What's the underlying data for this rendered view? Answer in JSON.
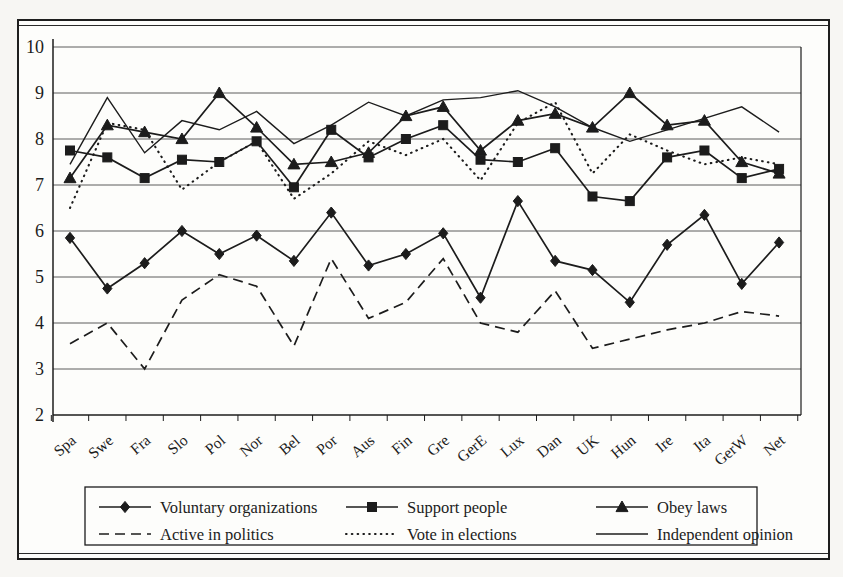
{
  "figure": {
    "background": "#fdfdfb",
    "ink_color": "#1c1c1c",
    "grid_color": "#4a4a4a"
  },
  "chart_data": {
    "type": "line",
    "title": "",
    "xlabel": "",
    "ylabel": "",
    "ylim": [
      2,
      10
    ],
    "yticks": [
      2,
      3,
      4,
      5,
      6,
      7,
      8,
      9,
      10
    ],
    "grid": true,
    "legend_position": "bottom-box",
    "categories": [
      "Spa",
      "Swe",
      "Fra",
      "Slo",
      "Pol",
      "Nor",
      "Bel",
      "Por",
      "Aus",
      "Fin",
      "Gre",
      "GerE",
      "Lux",
      "Dan",
      "UK",
      "Hun",
      "Ire",
      "Ita",
      "GerW",
      "Net"
    ],
    "series": [
      {
        "name": "Voluntary organizations",
        "marker": "diamond",
        "line": "solid",
        "values": [
          5.85,
          4.75,
          5.3,
          6.0,
          5.5,
          5.9,
          5.35,
          6.4,
          5.25,
          5.5,
          5.95,
          4.55,
          6.65,
          5.35,
          5.15,
          4.45,
          5.7,
          6.35,
          4.85,
          5.75
        ]
      },
      {
        "name": "Support people",
        "marker": "square",
        "line": "solid",
        "values": [
          7.75,
          7.6,
          7.15,
          7.55,
          7.5,
          7.95,
          6.95,
          8.2,
          7.6,
          8.0,
          8.3,
          7.55,
          7.5,
          7.8,
          6.75,
          6.65,
          7.6,
          7.75,
          7.15,
          7.35
        ]
      },
      {
        "name": "Obey laws",
        "marker": "triangle",
        "line": "solid",
        "values": [
          7.15,
          8.3,
          8.15,
          8.0,
          9.0,
          8.25,
          7.45,
          7.5,
          7.7,
          8.5,
          8.7,
          7.75,
          8.4,
          8.55,
          8.25,
          9.0,
          8.3,
          8.4,
          7.5,
          7.25
        ]
      },
      {
        "name": "Active in politics",
        "marker": "none",
        "line": "dashed",
        "values": [
          3.55,
          4.0,
          3.0,
          4.5,
          5.05,
          4.8,
          3.5,
          5.4,
          4.1,
          4.45,
          5.4,
          4.0,
          3.8,
          4.7,
          3.45,
          3.65,
          3.85,
          4.0,
          4.25,
          4.15
        ]
      },
      {
        "name": "Vote in elections",
        "marker": "none",
        "line": "dotted",
        "values": [
          6.5,
          8.35,
          8.2,
          6.9,
          7.5,
          7.95,
          6.7,
          7.25,
          7.95,
          7.65,
          8.0,
          7.1,
          8.35,
          8.8,
          7.25,
          8.1,
          7.75,
          7.45,
          7.6,
          7.45
        ]
      },
      {
        "name": "Independent opinion",
        "marker": "none",
        "line": "plain",
        "values": [
          7.45,
          8.9,
          7.7,
          8.4,
          8.2,
          8.6,
          7.9,
          8.3,
          8.8,
          8.5,
          8.85,
          8.9,
          9.05,
          8.7,
          8.25,
          7.95,
          8.2,
          8.45,
          8.7,
          8.15
        ]
      }
    ],
    "legend_rows": [
      [
        0,
        1,
        2
      ],
      [
        3,
        4,
        5
      ]
    ]
  }
}
